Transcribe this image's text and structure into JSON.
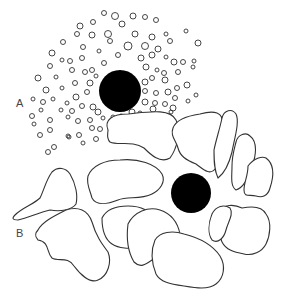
{
  "figure": {
    "background": "#ffffff",
    "stroke_color": "#333333",
    "fill_color": "#000000",
    "panels": [
      {
        "id": "A",
        "label": "A",
        "description": "Solid black sphere surrounded by many small dispersed droplets/vesicles",
        "nucleus": {
          "cx": 120,
          "cy": 91,
          "r": 21
        },
        "particles": [
          [
            80,
            26,
            3
          ],
          [
            93,
            22,
            2.5
          ],
          [
            104,
            13,
            2.5
          ],
          [
            115,
            16,
            3.5
          ],
          [
            133,
            16,
            3
          ],
          [
            145,
            17,
            2.5
          ],
          [
            156,
            20,
            2.5
          ],
          [
            63,
            42,
            2.5
          ],
          [
            77,
            34,
            2.5
          ],
          [
            92,
            35,
            3
          ],
          [
            108,
            34,
            3.5
          ],
          [
            122,
            24,
            3
          ],
          [
            135,
            34,
            3
          ],
          [
            152,
            37,
            3
          ],
          [
            166,
            34,
            2
          ],
          [
            186,
            31,
            2
          ],
          [
            52,
            53,
            3
          ],
          [
            62,
            60,
            2
          ],
          [
            83,
            47,
            2.5
          ],
          [
            99,
            51,
            2
          ],
          [
            110,
            41,
            2.5
          ],
          [
            128,
            46,
            4
          ],
          [
            145,
            46,
            3.5
          ],
          [
            158,
            49,
            3
          ],
          [
            170,
            41,
            2.5
          ],
          [
            198,
            43,
            3
          ],
          [
            50,
            66,
            2.5
          ],
          [
            70,
            61,
            2.5
          ],
          [
            82,
            58,
            2.5
          ],
          [
            92,
            70,
            2.5
          ],
          [
            104,
            63,
            2.5
          ],
          [
            118,
            55,
            2.5
          ],
          [
            141,
            58,
            3
          ],
          [
            152,
            55,
            3
          ],
          [
            166,
            57,
            2
          ],
          [
            174,
            62,
            3
          ],
          [
            183,
            62,
            2.5
          ],
          [
            194,
            61,
            2
          ],
          [
            38,
            78,
            3
          ],
          [
            56,
            77,
            2
          ],
          [
            72,
            70,
            2.5
          ],
          [
            85,
            72,
            2.5
          ],
          [
            96,
            76,
            2
          ],
          [
            146,
            67,
            3
          ],
          [
            157,
            70,
            2
          ],
          [
            164,
            73,
            2.5
          ],
          [
            178,
            72,
            2.5
          ],
          [
            193,
            67,
            2
          ],
          [
            46,
            90,
            3
          ],
          [
            62,
            88,
            2
          ],
          [
            75,
            83,
            2.5
          ],
          [
            90,
            83,
            3
          ],
          [
            145,
            82,
            3
          ],
          [
            152,
            78,
            2.5
          ],
          [
            165,
            80,
            3
          ],
          [
            177,
            88,
            2.5
          ],
          [
            187,
            85,
            3
          ],
          [
            33,
            99,
            2
          ],
          [
            43,
            102,
            2.5
          ],
          [
            53,
            99,
            2
          ],
          [
            67,
            103,
            2
          ],
          [
            76,
            97,
            3
          ],
          [
            87,
            92,
            2.5
          ],
          [
            145,
            91,
            2.5
          ],
          [
            156,
            93,
            2.5
          ],
          [
            168,
            92,
            3
          ],
          [
            175,
            98,
            2.5
          ],
          [
            196,
            95,
            2
          ],
          [
            32,
            116,
            2.5
          ],
          [
            41,
            110,
            2
          ],
          [
            50,
            120,
            2.5
          ],
          [
            61,
            110,
            2
          ],
          [
            72,
            111,
            2.5
          ],
          [
            82,
            106,
            2.5
          ],
          [
            93,
            107,
            3
          ],
          [
            98,
            112,
            3
          ],
          [
            145,
            102,
            3
          ],
          [
            155,
            103,
            2.5
          ],
          [
            165,
            104,
            2.5
          ],
          [
            173,
            108,
            3
          ],
          [
            188,
            101,
            2
          ],
          [
            34,
            124,
            2
          ],
          [
            50,
            130,
            2.5
          ],
          [
            68,
            117,
            2
          ],
          [
            78,
            121,
            2.5
          ],
          [
            90,
            120,
            2.5
          ],
          [
            103,
            118,
            2
          ],
          [
            113,
            117,
            2
          ],
          [
            121,
            116,
            2
          ],
          [
            132,
            112,
            3
          ],
          [
            140,
            113,
            2
          ],
          [
            153,
            109,
            3
          ],
          [
            171,
            112,
            2
          ],
          [
            40,
            135,
            2.5
          ],
          [
            54,
            147,
            2.5
          ],
          [
            68,
            136,
            2
          ],
          [
            79,
            135,
            2.5
          ],
          [
            92,
            128,
            2.5
          ],
          [
            100,
            129,
            2.5
          ],
          [
            48,
            152,
            2.5
          ],
          [
            69,
            137,
            2
          ],
          [
            83,
            143,
            2
          ],
          [
            96,
            139,
            2.5
          ]
        ]
      },
      {
        "id": "B",
        "label": "B",
        "description": "Solid black sphere surrounded by large irregular, flattened cell-like shapes",
        "nucleus": {
          "cx": 191,
          "cy": 193,
          "r": 20
        },
        "blobs": [
          "M108,130 C104,120 112,114 128,114 C148,112 170,108 176,120 C182,132 176,150 170,158 C160,164 150,154 144,148 C132,140 118,146 110,142 C106,138 108,134 108,130 Z",
          "M173,128 C176,120 186,116 200,114 C214,110 224,112 222,124 C220,140 222,158 216,168 C210,176 204,170 196,164 C186,160 180,156 178,148 C176,140 170,136 173,128 Z",
          "M222,118 C224,110 232,108 236,114 C240,122 234,140 232,152 C230,160 226,172 218,178 C214,170 214,160 214,150 C216,140 220,128 222,118 Z",
          "M236,142 C238,134 246,132 250,136 C258,142 256,156 252,166 C248,180 242,188 236,190 C230,186 232,176 232,166 C232,156 234,150 236,142 Z",
          "M248,166 C254,158 262,156 266,158 C274,164 274,176 270,188 C268,196 262,198 256,196 C250,194 244,198 244,190 C244,182 248,176 248,166 Z",
          "M15,215 C22,208 34,204 40,198 C44,190 46,180 52,172 C58,166 66,168 70,174 C76,184 78,196 76,204 C72,210 60,212 50,210 C40,212 28,218 18,220 C12,220 12,218 15,215 Z",
          "M88,176 C92,166 104,160 120,160 C138,158 156,164 162,174 C166,182 160,190 152,194 C140,200 128,196 118,200 C108,204 96,206 92,198 C90,190 86,184 88,176 Z",
          "M38,230 C42,222 54,216 66,210 C78,206 88,210 92,222 C96,236 102,244 108,252 C112,262 108,276 98,280 C90,284 80,274 74,266 C68,256 58,262 52,258 C46,252 50,242 38,240 C34,236 36,232 38,230 Z",
          "M102,218 C106,210 116,206 128,206 C140,206 150,210 154,220 C158,232 150,242 140,246 C130,250 118,248 112,244 C106,240 102,232 102,218 Z",
          "M128,224 C134,212 148,206 160,210 C172,214 178,224 180,234 C178,244 168,250 158,256 C148,262 142,270 134,262 C128,252 126,240 128,224 Z",
          "M218,212 C224,204 234,204 242,208 C252,206 262,206 266,214 C272,222 270,236 266,244 C262,252 252,256 244,254 C234,252 226,250 222,242 C218,234 220,226 224,220 C222,216 218,216 218,212 Z",
          "M155,240 C160,232 172,230 184,234 C200,238 212,244 220,256 C226,266 224,278 216,284 C208,290 196,288 184,286 C170,284 160,282 156,274 C152,264 150,252 155,240 Z",
          "M212,214 C216,206 224,204 230,208 C234,214 228,222 226,230 C224,238 218,244 212,240 C208,234 208,224 212,214 Z"
        ]
      }
    ]
  }
}
